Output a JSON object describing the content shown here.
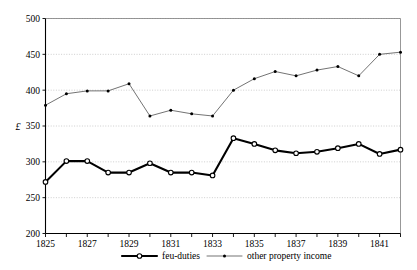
{
  "chart_data": {
    "type": "line",
    "title": "",
    "subtitle": "",
    "xlabel": "",
    "ylabel": "£",
    "ylim": [
      200,
      500
    ],
    "xlim": [
      1825,
      1842
    ],
    "grid": true,
    "legend_position": "bottom-center",
    "yticks": [
      200,
      250,
      300,
      350,
      400,
      450,
      500
    ],
    "ytick_labels": [
      "200",
      "250",
      "300",
      "350",
      "400",
      "450",
      "500"
    ],
    "x": [
      1825,
      1826,
      1827,
      1828,
      1829,
      1830,
      1831,
      1832,
      1833,
      1834,
      1835,
      1836,
      1837,
      1838,
      1839,
      1840,
      1841,
      1842
    ],
    "xtick_labels": [
      "1825",
      "",
      "1827",
      "",
      "1829",
      "",
      "1831",
      "",
      "1833",
      "",
      "1835",
      "",
      "1837",
      "",
      "1839",
      "",
      "1841",
      ""
    ],
    "xtick_labelled_years": [
      1825,
      1827,
      1829,
      1831,
      1833,
      1835,
      1837,
      1839,
      1841
    ],
    "series": [
      {
        "name": "feu-duties",
        "marker": "open-circle",
        "line_style": "solid-thick",
        "color": "#000000",
        "values": [
          272,
          301,
          301,
          285,
          285,
          298,
          285,
          285,
          281,
          333,
          325,
          316,
          312,
          314,
          319,
          325,
          311,
          317
        ]
      },
      {
        "name": "other property income",
        "marker": "small-dot",
        "line_style": "solid-thin",
        "color": "#5a5a5a",
        "values": [
          379,
          395,
          399,
          399,
          409,
          364,
          372,
          367,
          364,
          400,
          416,
          426,
          420,
          428,
          433,
          420,
          450,
          453
        ]
      }
    ]
  },
  "legend": {
    "items": [
      {
        "label": "feu-duties"
      },
      {
        "label": "other property income"
      }
    ]
  },
  "axis": {
    "y_unit_symbol": "£"
  }
}
